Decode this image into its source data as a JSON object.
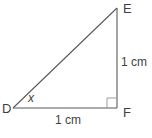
{
  "diagram": {
    "vertices": {
      "d": "D",
      "e": "E",
      "f": "F"
    },
    "angle": {
      "at_vertex": "D",
      "label": "x"
    },
    "sides": {
      "vertical_ef": "1 cm",
      "horizontal_df": "1 cm"
    },
    "right_angle_at": "F",
    "colors": {
      "line": "#58595b",
      "right_angle_marker": "#9b9b9d",
      "text": "#3f3f41",
      "background": "#ffffff"
    }
  }
}
